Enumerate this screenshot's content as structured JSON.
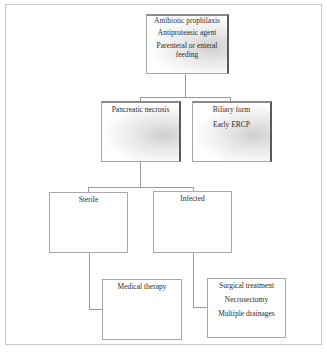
{
  "diagram": {
    "type": "flowchart",
    "nodes": {
      "root": {
        "lines": [
          "Antibiotic prophilaxis",
          "Antiproteasic agent",
          "Parenteral or enteral feeding"
        ]
      },
      "pancreatic_necrosis": {
        "lines": [
          "Pancreatic necrosis"
        ]
      },
      "biliary_form": {
        "lines": [
          "Biliary form",
          "Early ERCP"
        ]
      },
      "sterile": {
        "lines": [
          "Sterile"
        ]
      },
      "infected": {
        "lines": [
          "Infected"
        ]
      },
      "medical_therapy": {
        "lines": [
          "Medical therapy"
        ]
      },
      "surgical_treatment": {
        "lines": [
          "Surgical treatment",
          "Necrosectomy",
          "Multiple drainages"
        ]
      }
    },
    "edges": [
      [
        "root",
        "pancreatic_necrosis"
      ],
      [
        "root",
        "biliary_form"
      ],
      [
        "pancreatic_necrosis",
        "sterile"
      ],
      [
        "pancreatic_necrosis",
        "infected"
      ],
      [
        "sterile",
        "medical_therapy"
      ],
      [
        "infected",
        "surgical_treatment"
      ]
    ],
    "colors": {
      "border": "#a8a8a8",
      "shadow": "#5a5a5a",
      "connector": "#9a9a9a",
      "frame": "#c8c8c8"
    }
  }
}
